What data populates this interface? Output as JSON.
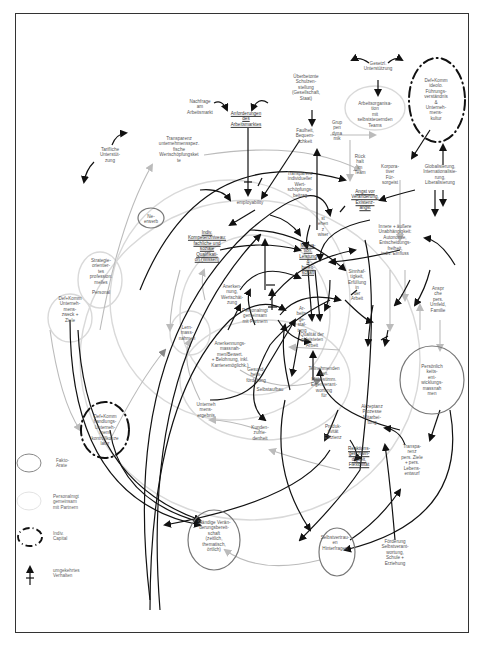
{
  "diagram": {
    "type": "causal-loop-diagram",
    "language": "de",
    "nodes": [
      {
        "id": "nachfrage",
        "label": "Nachfrage\nam\nArbeitsmarkt",
        "x": 200,
        "y": 107
      },
      {
        "id": "anforderungen",
        "label": "Anforderungen\ndes\nArbeitsmarktes",
        "x": 246,
        "y": 119,
        "underlined": true
      },
      {
        "id": "gesetz",
        "label": "Gesetzl.\nUnterstützung",
        "x": 378,
        "y": 66
      },
      {
        "id": "ueberbetonte",
        "label": "Überbetonte\nSchulzen-\nstellung\n(Gesellschaft,\nStaat)",
        "x": 306,
        "y": 88
      },
      {
        "id": "arbeitsorganisation",
        "label": "Arbeitsorganisa-\ntion\nmit\nselbststeuernden\nTeams",
        "x": 375,
        "y": 115
      },
      {
        "id": "unternehmenskultur",
        "label": "Def+Komm\nideolo.\nFührungs-\nverständnis\n&\nUnterneh-\nmens-\nkultur",
        "x": 436,
        "y": 100
      },
      {
        "id": "tarifliche",
        "label": "Tarifliche\nUnterstüt-\nzung",
        "x": 110,
        "y": 155
      },
      {
        "id": "transparenz_unt",
        "label": "Transparenz\nunternehmensspez.\nfische\nWertschöpfungsket\nte",
        "x": 179,
        "y": 150
      },
      {
        "id": "gruppendynamik",
        "label": "Grup\npen\ndyna\nmik",
        "x": 337,
        "y": 131
      },
      {
        "id": "faulheit",
        "label": "Faulheit,\nBequem-\nlichkeit",
        "x": 305,
        "y": 136
      },
      {
        "id": "rueckhalt",
        "label": "Rück\nhalt\nim\nTeam",
        "x": 360,
        "y": 165
      },
      {
        "id": "korporatismus",
        "label": "Korpora-\ntiver\nFür-\nsorgeist",
        "x": 390,
        "y": 175
      },
      {
        "id": "globalisierung",
        "label": "Globalisierung,\nInternationalisie-\nrung,\nLiberalisierung",
        "x": 440,
        "y": 175
      },
      {
        "id": "transparenz_ind",
        "label": "Transparenz\nindividueller\nWert-\nschöpfungs-\nbeitrag",
        "x": 300,
        "y": 185
      },
      {
        "id": "angst",
        "label": "Angst vor\nVeränderung,\nExistenz-\nangst",
        "x": 365,
        "y": 200,
        "underlined": true
      },
      {
        "id": "employability",
        "label": "employability",
        "x": 250,
        "y": 203
      },
      {
        "id": "nebenerwerb",
        "label": "Ne-\nerwerb",
        "x": 151,
        "y": 219
      },
      {
        "id": "stehen",
        "label": "st\nehen\nz\nwiser",
        "x": 323,
        "y": 227
      },
      {
        "id": "indiv_kompetenzen",
        "label": "Indiv.\nKompetenzniveau:\nfachliche und\nsoziale\nQualifikati-\non (Wissen)",
        "x": 207,
        "y": 246,
        "underlined": true
      },
      {
        "id": "innere_aeussere",
        "label": "Innere + äußere\nUnabhängigkeit:\nAutonomie,\nEntscheidungs-\nfreiheit,\nindiv. Einfluss",
        "x": 395,
        "y": 240
      },
      {
        "id": "motivation",
        "label": "Motiva-\ntion:\nLeistung\n&\nbereit-\nschaft",
        "x": 308,
        "y": 259,
        "underlined": true
      },
      {
        "id": "strategie",
        "label": "Strategie-\norientier-\ntes\nprofession.\nmelles",
        "x": 101,
        "y": 272
      },
      {
        "id": "sinnhaftigkeit",
        "label": "Sinnhaf-\ntigkeit,\nErfüllung\nin\nder\nArbeit",
        "x": 357,
        "y": 285
      },
      {
        "id": "anspruch",
        "label": "Anspr\nche\npers.\nUmfeld,\nFamilie",
        "x": 438,
        "y": 300
      },
      {
        "id": "anerkennung",
        "label": "Anerken-\nnung,\nWertschät-\nzung",
        "x": 232,
        "y": 295
      },
      {
        "id": "personal",
        "label": "Personal",
        "x": 101,
        "y": 293
      },
      {
        "id": "personalmgmt",
        "label": "Personalmgt\ngemeinsam\nmit Partnern",
        "x": 255,
        "y": 316
      },
      {
        "id": "arbeitsgestaltung",
        "label": "Ar-\nbeits-\nge-\nstal-\ntung",
        "x": 302,
        "y": 320
      },
      {
        "id": "lernmassnahmen",
        "label": "Lern-\nmass-\nnahmen",
        "x": 187,
        "y": 333
      },
      {
        "id": "def_unternehmenszweck",
        "label": "Def+Komm\nUnterneh-\nmens-\nzweck +\nZiele",
        "x": 70,
        "y": 310
      },
      {
        "id": "qualitaet",
        "label": "Qualität der\ngeleisteten\nArbeit",
        "x": 312,
        "y": 340
      },
      {
        "id": "anerkennungsmassnahmen",
        "label": "Anerkennungs-\nmassnah-\nmen/Bewert.\n+ Belohnung, inkl.\nKarrieremöglichk.)",
        "x": 230,
        "y": 355
      },
      {
        "id": "gesundheit",
        "label": "Gesund-\nheits-\nförderung",
        "x": 256,
        "y": 375
      },
      {
        "id": "teilnehmenden",
        "label": "Teilnehmenden\nken.\nMitbestimm.\nEigenverant-\nwortung\nfür",
        "x": 324,
        "y": 382
      },
      {
        "id": "persoenlichkeit",
        "label": "Persönlich\nkeits-\nent-\nwicklungs-\nmassnah\nmen",
        "x": 432,
        "y": 380
      },
      {
        "id": "selbstaufbau",
        "label": "Selbstaufbau",
        "x": 270,
        "y": 390
      },
      {
        "id": "unternehmensergebnis",
        "label": "Unterneh\nmens-\nergebnis",
        "x": 206,
        "y": 410
      },
      {
        "id": "def_kunden",
        "label": "Def+Komm\nhandlungs-\nUnterneh-\nmens\nkontrollkonze\nlatur",
        "x": 105,
        "y": 430
      },
      {
        "id": "akzeptanz",
        "label": "Akzeptanz\nProzesse\nMitarbei-\ntung",
        "x": 372,
        "y": 415
      },
      {
        "id": "kundenzufriedenheit",
        "label": "Kunden-\nzufrie-\ndenheit",
        "x": 260,
        "y": 433
      },
      {
        "id": "produktivitaet",
        "label": "Produk-\ntivität\nEffizienz",
        "x": 333,
        "y": 432
      },
      {
        "id": "reaktion",
        "label": "Reaktions-\ngeschwin-\ndigkeit,\nFlexibilität",
        "x": 359,
        "y": 457,
        "underlined": true
      },
      {
        "id": "transparenz_ziele",
        "label": "Transpa-\nrenz\npers. Ziele\n+ pers.\nLebens-\nentwurf",
        "x": 412,
        "y": 460
      },
      {
        "id": "staendige",
        "label": "Ständige Verän-\nderungsbereit-\nschaft\n(zeitlich,\nthematisch,\nörtlich)",
        "x": 214,
        "y": 536
      },
      {
        "id": "selbstvertrauen",
        "label": "Selbstvertrau-\nen\nHinterfragen",
        "x": 335,
        "y": 543
      },
      {
        "id": "foerderung",
        "label": "Förderung\nSelbstverant-\nwortung,\nSchule +\nErziehung",
        "x": 395,
        "y": 553
      }
    ],
    "legend": [
      {
        "symbol": "solid-ellipse",
        "label": "Fakto-\nArate"
      },
      {
        "symbol": "light-ellipse",
        "label": "Personalmgt\ngemeinsam\nmit Partnern"
      },
      {
        "symbol": "dashed-dotted-ellipse",
        "label": "Indiv.\nCapital"
      },
      {
        "symbol": "crossed-arrow",
        "label": "umgekehrtes\nVerhalten"
      }
    ],
    "colors": {
      "strong_link": "#111111",
      "weak_link": "#bdbdbd",
      "medium_link": "#888888",
      "frame": "#333333",
      "text": "#555555"
    }
  }
}
